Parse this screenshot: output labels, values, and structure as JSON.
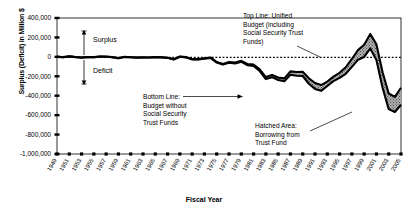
{
  "chart_data": {
    "type": "area",
    "title": "",
    "xlabel": "Fiscal Year",
    "ylabel": "Surplus (Deficit) in Million $",
    "ylim": [
      -1000000,
      400000
    ],
    "yticks": [
      400000,
      200000,
      0,
      -200000,
      -400000,
      -600000,
      -800000,
      -1000000
    ],
    "ytick_labels": [
      "400,000",
      "200,000",
      "0",
      "-200,000",
      "-400,000",
      "-600,000",
      "-800,000",
      "-1,000,000"
    ],
    "grid": false,
    "legend_position": "annotations",
    "xlim": [
      1949,
      2005
    ],
    "categories": [
      1949,
      1950,
      1951,
      1952,
      1953,
      1954,
      1955,
      1956,
      1957,
      1958,
      1959,
      1960,
      1961,
      1962,
      1963,
      1964,
      1965,
      1966,
      1967,
      1968,
      1969,
      1970,
      1971,
      1972,
      1973,
      1974,
      1975,
      1976,
      1977,
      1978,
      1979,
      1980,
      1981,
      1982,
      1983,
      1984,
      1985,
      1986,
      1987,
      1988,
      1989,
      1990,
      1991,
      1992,
      1993,
      1994,
      1995,
      1996,
      1997,
      1998,
      1999,
      2000,
      2001,
      2002,
      2003,
      2004,
      2005
    ],
    "xtick_labels": [
      "1949",
      "1951",
      "1953",
      "1955",
      "1957",
      "1959",
      "1961",
      "1963",
      "1965",
      "1967",
      "1969",
      "1971",
      "1973",
      "1975",
      "1977",
      "1979",
      "1981",
      "1983",
      "1985",
      "1987",
      "1989",
      "1991",
      "1993",
      "1995",
      "1997",
      "1999",
      "2001",
      "2003",
      "2005"
    ],
    "series": [
      {
        "name": "Top Line: Unified Budget (including Social Security Trust Funds)",
        "values": [
          580,
          -3100,
          6100,
          -1500,
          -6500,
          -1200,
          -3000,
          3900,
          3400,
          -2800,
          -12800,
          300,
          -3300,
          -7100,
          -4800,
          -5900,
          -1400,
          -3700,
          -8600,
          -25200,
          3200,
          -2800,
          -23000,
          -23400,
          -14900,
          -6100,
          -53200,
          -73700,
          -53700,
          -59200,
          -40700,
          -73800,
          -79000,
          -128000,
          -207800,
          -185400,
          -212300,
          -221200,
          -149700,
          -155200,
          -152600,
          -221000,
          -269200,
          -290300,
          -255100,
          -203200,
          -164000,
          -107400,
          -21900,
          69300,
          125600,
          236200,
          128200,
          -157800,
          -377600,
          -412700,
          -318300
        ]
      },
      {
        "name": "Bottom Line: Budget without Social Security Trust Funds",
        "values": [
          -320,
          -4100,
          4900,
          -2600,
          -7600,
          -2300,
          -4200,
          2400,
          1800,
          -4400,
          -14100,
          -900,
          -4600,
          -8400,
          -6100,
          -7200,
          -2600,
          -5100,
          -10200,
          -27000,
          1100,
          -5100,
          -26000,
          -26800,
          -19200,
          -11000,
          -58700,
          -79800,
          -60700,
          -67500,
          -50000,
          -85000,
          -94000,
          -146000,
          -229000,
          -209000,
          -238000,
          -252000,
          -184000,
          -195000,
          -197000,
          -277000,
          -330000,
          -350000,
          -300000,
          -250000,
          -216000,
          -174000,
          -103000,
          -30000,
          -1000,
          86400,
          -33400,
          -317400,
          -538400,
          -567000,
          -493600
        ]
      }
    ],
    "annotations": [
      {
        "id": "top-line-note",
        "text_lines": [
          "Top Line: Unified",
          "Budget (including",
          "Social Security Trust",
          "Funds)"
        ]
      },
      {
        "id": "bottom-line-note",
        "text_lines": [
          "Bottom Line:",
          "Budget without",
          "Social Security",
          "Trust Funds"
        ]
      },
      {
        "id": "hatched-area-note",
        "text_lines": [
          "Hatched Area:",
          "Borrowing from",
          "Trust Fund"
        ]
      },
      {
        "id": "surplus-arrow",
        "text": "Surplus"
      },
      {
        "id": "deficit-arrow",
        "text": "Deficit"
      }
    ]
  }
}
